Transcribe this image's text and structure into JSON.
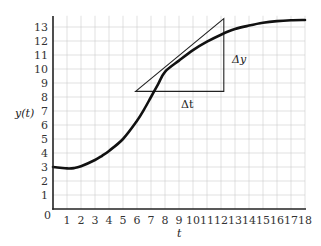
{
  "chart_data": {
    "type": "line",
    "title": "",
    "xlabel": "t",
    "ylabel": "y(t)",
    "xlim": [
      0,
      18
    ],
    "ylim": [
      0,
      13.8
    ],
    "grid": true,
    "legend": null,
    "x_ticks": [
      "0",
      "1",
      "2",
      "3",
      "4",
      "5",
      "6",
      "7",
      "8",
      "9",
      "10",
      "11",
      "12",
      "13",
      "14",
      "15",
      "16",
      "17",
      "18"
    ],
    "y_ticks": [
      "1",
      "2",
      "3",
      "4",
      "5",
      "6",
      "7",
      "8",
      "9",
      "10",
      "11",
      "12",
      "13"
    ],
    "series": [
      {
        "name": "y(t)",
        "x": [
          0,
          0.5,
          1,
          1.5,
          2,
          3,
          3.5,
          4,
          5,
          6,
          6.5,
          7,
          7.5,
          8,
          9,
          10,
          11,
          12,
          13,
          14,
          15,
          16,
          17,
          18
        ],
        "y": [
          3.0,
          2.95,
          2.9,
          2.92,
          3.05,
          3.5,
          3.8,
          4.15,
          5.0,
          6.3,
          7.1,
          8.0,
          8.9,
          9.8,
          10.6,
          11.35,
          11.95,
          12.45,
          12.85,
          13.1,
          13.3,
          13.42,
          13.48,
          13.5
        ]
      }
    ],
    "annotations": [
      {
        "type": "tangent_triangle",
        "hypotenuse_from": [
          5.9,
          8.4
        ],
        "hypotenuse_to": [
          12.2,
          13.6
        ],
        "right_angle_at": [
          12.2,
          8.4
        ],
        "labels": {
          "dx": "Δt",
          "dy": "Δy"
        }
      }
    ]
  },
  "labels": {
    "ylabel": "y(t)",
    "xlabel": "t",
    "delta_t": "Δt",
    "delta_y": "Δy",
    "origin": "0"
  }
}
